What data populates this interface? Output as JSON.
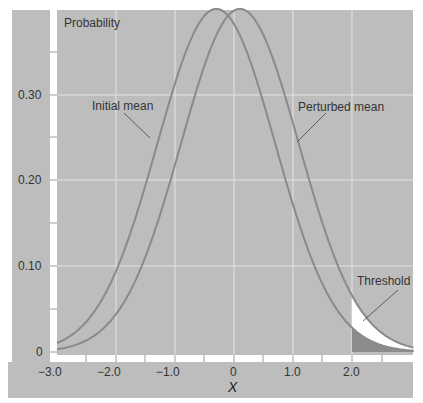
{
  "chart_data": {
    "type": "line",
    "title": "",
    "ylabel": "Probability",
    "xlabel": "x",
    "xlim": [
      -3.0,
      3.0
    ],
    "ylim": [
      0,
      0.4
    ],
    "x_ticks": [
      "-3.0",
      "-2.0",
      "-1.0",
      "0",
      "1.0",
      "2.0"
    ],
    "y_ticks": [
      "0",
      "0.10",
      "0.20",
      "0.30"
    ],
    "grid": true,
    "series": [
      {
        "name": "Initial mean",
        "distribution": "normal",
        "mean": -0.3,
        "sd": 1.0,
        "peak": 0.4
      },
      {
        "name": "Perturbed mean",
        "distribution": "normal",
        "mean": 0.1,
        "sd": 1.0,
        "peak": 0.4
      }
    ],
    "annotations": [
      {
        "text": "Initial mean",
        "target": "Initial mean curve"
      },
      {
        "text": "Perturbed mean",
        "target": "Perturbed mean curve"
      },
      {
        "text": "Threshold",
        "x": 2.0,
        "note": "shaded tail region beyond x = 2.0"
      }
    ]
  },
  "labels": {
    "ylabel": "Probability",
    "xlabel": "X",
    "initial": "Initial mean",
    "perturbed": "Perturbed mean",
    "threshold": "Threshold"
  },
  "ticks": {
    "x": [
      "−3.0",
      "−2.0",
      "−1.0",
      "0",
      "1.0",
      "2.0"
    ],
    "y": [
      "0",
      "0.10",
      "0.20",
      "0.30"
    ]
  },
  "colors": {
    "background": "#bdbdbd",
    "curve": "#8a8a8a",
    "grid": "#e4e4e4",
    "tail_fill": "#ffffff",
    "tail_shade": "#8c8c8c"
  }
}
